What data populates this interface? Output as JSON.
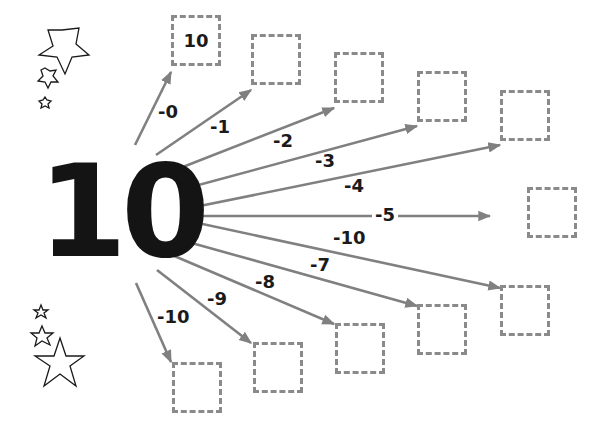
{
  "worksheet": {
    "center_number": "10",
    "ink_color": "#141414",
    "arrow_color": "#808080",
    "box_border_color": "#8a8a8a"
  },
  "branches": [
    {
      "operation": "-0",
      "answer": "10",
      "start": [
        135,
        145
      ],
      "end": [
        171,
        72
      ],
      "box": [
        171,
        15
      ],
      "label_pos": [
        158,
        103
      ]
    },
    {
      "operation": "-1",
      "answer": "",
      "start": [
        156,
        155
      ],
      "end": [
        251,
        90
      ],
      "box": [
        251,
        34
      ],
      "label_pos": [
        210,
        118
      ]
    },
    {
      "operation": "-2",
      "answer": "",
      "start": [
        170,
        172
      ],
      "end": [
        334,
        108
      ],
      "box": [
        334,
        52
      ],
      "label_pos": [
        273,
        132
      ]
    },
    {
      "operation": "-3",
      "answer": "",
      "start": [
        180,
        190
      ],
      "end": [
        417,
        126
      ],
      "box": [
        417,
        71
      ],
      "label_pos": [
        315,
        152
      ]
    },
    {
      "operation": "-4",
      "answer": "",
      "start": [
        180,
        210
      ],
      "end": [
        500,
        145
      ],
      "box": [
        500,
        90
      ],
      "label_pos": [
        344,
        177
      ]
    },
    {
      "operation": "-5",
      "answer": "",
      "start": [
        199,
        216
      ],
      "end": [
        490,
        216
      ],
      "box": [
        527,
        187
      ],
      "label_pos": [
        372,
        206
      ]
    },
    {
      "operation": "-10",
      "answer": "",
      "start": [
        184,
        220
      ],
      "end": [
        500,
        288
      ],
      "box": [
        500,
        285
      ],
      "label_pos": [
        333,
        229
      ]
    },
    {
      "operation": "-7",
      "answer": "",
      "start": [
        181,
        240
      ],
      "end": [
        417,
        306
      ],
      "box": [
        417,
        304
      ],
      "label_pos": [
        310,
        256
      ]
    },
    {
      "operation": "-8",
      "answer": "",
      "start": [
        172,
        255
      ],
      "end": [
        334,
        324
      ],
      "box": [
        335,
        323
      ],
      "label_pos": [
        255,
        273
      ]
    },
    {
      "operation": "-9",
      "answer": "",
      "start": [
        157,
        270
      ],
      "end": [
        251,
        343
      ],
      "box": [
        253,
        342
      ],
      "label_pos": [
        207,
        290
      ]
    },
    {
      "operation": "-10",
      "answer": "",
      "start": [
        136,
        283
      ],
      "end": [
        171,
        362
      ],
      "box": [
        172,
        362
      ],
      "label_pos": [
        157,
        308
      ]
    }
  ],
  "decorations": {
    "top_left_stars": [
      "large-star",
      "medium-star",
      "small-star"
    ],
    "bottom_left_stars": [
      "small-star",
      "medium-star",
      "large-star"
    ]
  }
}
